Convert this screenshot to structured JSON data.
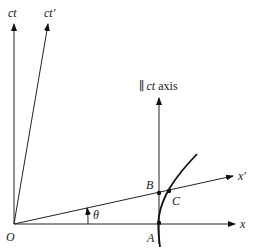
{
  "diagram": {
    "type": "spacetime-diagram",
    "axes": {
      "ct": {
        "label": "ct"
      },
      "ct_prime": {
        "label": "ct′"
      },
      "x": {
        "label": "x"
      },
      "x_prime": {
        "label": "x′"
      },
      "parallel_ct": {
        "prefix": "∥",
        "italic": "ct",
        "suffix": " axis"
      }
    },
    "points": {
      "origin": {
        "label": "O"
      },
      "A": {
        "label": "A"
      },
      "B": {
        "label": "B"
      },
      "C": {
        "label": "C"
      }
    },
    "angle": {
      "label": "θ"
    },
    "colors": {
      "ink": "#111111",
      "background": "#ffffff"
    }
  }
}
